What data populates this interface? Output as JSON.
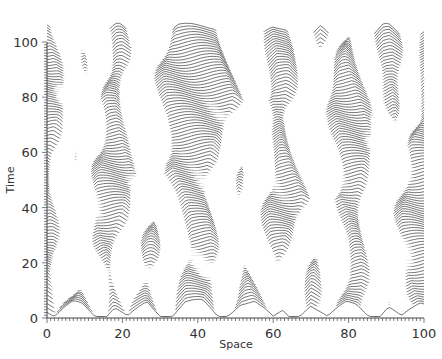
{
  "chart_data": {
    "type": "line",
    "subtype": "waterfall-stacked-profiles",
    "title": "",
    "xlabel": "Space",
    "ylabel": "Time",
    "xlim": [
      0,
      100
    ],
    "ylim": [
      0,
      100
    ],
    "x_ticks": [
      0,
      20,
      40,
      60,
      80,
      100
    ],
    "y_ticks": [
      0,
      20,
      40,
      60,
      80,
      100
    ],
    "x_minor_step": 1,
    "y_minor_step": 1,
    "grid": false,
    "legend": null,
    "num_time_slices": 101,
    "time_step": 1,
    "profile_amplitude_time_units": 7,
    "line_color": "#1a1a1a",
    "valley_trajectories": [
      {
        "x0": 2,
        "drift": 0.1
      },
      {
        "x0": 12,
        "drift": -0.05
      },
      {
        "x0": 22,
        "drift": 0.08
      },
      {
        "x0": 34,
        "drift": -0.12
      },
      {
        "x0": 45,
        "drift": 0.1
      },
      {
        "x0": 58,
        "drift": -0.06
      },
      {
        "x0": 67,
        "drift": 0.09
      },
      {
        "x0": 76,
        "drift": -0.1
      },
      {
        "x0": 85,
        "drift": 0.12
      },
      {
        "x0": 93,
        "drift": -0.07
      }
    ]
  },
  "axes": {
    "x_title": "Space",
    "y_title": "Time",
    "x_tick_labels": [
      "0",
      "20",
      "40",
      "60",
      "80",
      "100"
    ],
    "y_tick_labels": [
      "0",
      "20",
      "40",
      "60",
      "80",
      "100"
    ]
  }
}
